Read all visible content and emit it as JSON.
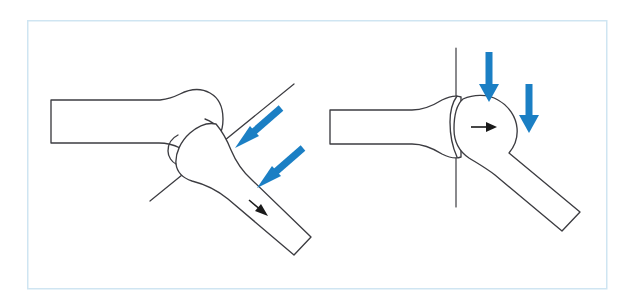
{
  "figure": {
    "background_color": "#ffffff",
    "frame": {
      "name": "figure-border",
      "stroke_color": "#cfe5f2",
      "stroke_width": 1.5,
      "x": 27,
      "y": 20,
      "width": 579,
      "height": 268
    },
    "colors": {
      "bone_outline": "#3c3c41",
      "force_arrow_blue": "#1b7fc4",
      "motion_arrow_black": "#1a1a1a",
      "frame_blue": "#cfe5f2",
      "canvas_white": "#ffffff"
    },
    "panels": [
      {
        "id": "panel-left",
        "name": "left-panel-abnormal-contact",
        "label": "",
        "axis": {
          "name": "oblique-reference-axis",
          "type": "oblique",
          "x1": 150,
          "y1": 201,
          "x2": 294,
          "y2": 84,
          "angle_deg": -39
        },
        "force_arrows": [
          {
            "name": "force-arrow-upper",
            "direction": "down-left",
            "tip_x": 237,
            "tip_y": 146,
            "tail_x": 279,
            "tail_y": 110,
            "color": "#1b7fc4",
            "thickness": 7
          },
          {
            "name": "force-arrow-lower",
            "direction": "down-left",
            "tip_x": 259,
            "tip_y": 186,
            "tail_x": 301,
            "tail_y": 150,
            "color": "#1b7fc4",
            "thickness": 7
          }
        ],
        "motion_arrows": [
          {
            "name": "motion-arrow-left-shaft",
            "direction": "down-right",
            "tip_x": 267,
            "tip_y": 215,
            "tail_x": 249,
            "tail_y": 200,
            "color": "#1a1a1a"
          }
        ],
        "bones": [
          {
            "name": "acetabulum-socket",
            "type": "socket-cup"
          },
          {
            "name": "femur-head-left",
            "type": "femoral-head"
          },
          {
            "name": "femur-shaft-left",
            "type": "angled-shaft"
          }
        ]
      },
      {
        "id": "panel-right",
        "name": "right-panel-normal-contact",
        "label": "",
        "axis": {
          "name": "vertical-reference-axis",
          "type": "vertical",
          "x1": 456,
          "y1": 48,
          "x2": 456,
          "y2": 207,
          "angle_deg": 90
        },
        "force_arrows": [
          {
            "name": "force-arrow-inner",
            "direction": "down",
            "tip_x": 489,
            "tip_y": 100,
            "tail_x": 489,
            "tail_y": 52,
            "color": "#1b7fc4",
            "thickness": 7
          },
          {
            "name": "force-arrow-outer",
            "direction": "down",
            "tip_x": 529,
            "tip_y": 131,
            "tail_x": 529,
            "tail_y": 84,
            "color": "#1b7fc4",
            "thickness": 7
          }
        ],
        "motion_arrows": [
          {
            "name": "motion-arrow-right-head",
            "direction": "right",
            "tip_x": 496,
            "tip_y": 127,
            "tail_x": 473,
            "tail_y": 127,
            "color": "#1a1a1a"
          }
        ],
        "bones": [
          {
            "name": "acetabulum-socket",
            "type": "socket-flared"
          },
          {
            "name": "femur-head-right",
            "type": "femoral-head-round"
          },
          {
            "name": "femur-shaft-right",
            "type": "angled-shaft"
          }
        ]
      }
    ]
  }
}
